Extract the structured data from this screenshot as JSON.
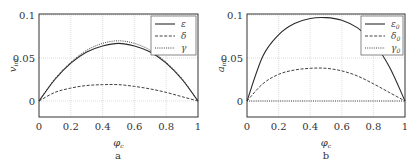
{
  "chart_data": [
    {
      "type": "line",
      "panel_label": "a",
      "title": "",
      "xlabel": "φ_{c_i}",
      "ylabel": "v_{ini}",
      "xlim": [
        0,
        1
      ],
      "ylim": [
        -0.02,
        0.1
      ],
      "xticks": [
        0,
        0.2,
        0.4,
        0.6,
        0.8,
        1
      ],
      "xtick_labels": [
        "0",
        "0.2",
        "0.4",
        "0.6",
        "0.8",
        "1"
      ],
      "yticks": [
        0,
        0.05,
        0.1
      ],
      "ytick_labels": [
        "0",
        "0.05",
        "0.1"
      ],
      "grid": true,
      "legend_position": "upper right",
      "x": [
        0,
        0.1,
        0.2,
        0.3,
        0.4,
        0.5,
        0.6,
        0.7,
        0.8,
        0.9,
        1.0
      ],
      "series": [
        {
          "name": "ε",
          "style": "solid",
          "values": [
            0,
            0.025,
            0.044,
            0.057,
            0.064,
            0.067,
            0.064,
            0.057,
            0.044,
            0.025,
            0
          ]
        },
        {
          "name": "δ",
          "style": "dashed",
          "values": [
            0,
            0.01,
            0.015,
            0.018,
            0.019,
            0.019,
            0.017,
            0.014,
            0.01,
            0.005,
            0
          ]
        },
        {
          "name": "γ",
          "style": "dotted",
          "values": [
            0,
            0.026,
            0.045,
            0.059,
            0.067,
            0.07,
            0.067,
            0.059,
            0.045,
            0.026,
            0
          ]
        }
      ]
    },
    {
      "type": "line",
      "panel_label": "b",
      "title": "",
      "xlabel": "φ_{c_i}",
      "ylabel": "a_{ini}",
      "xlim": [
        0,
        1
      ],
      "ylim": [
        -0.02,
        0.1
      ],
      "xticks": [
        0,
        0.2,
        0.4,
        0.6,
        0.8,
        1
      ],
      "xtick_labels": [
        "0",
        "0.2",
        "0.4",
        "0.6",
        "0.8",
        "1"
      ],
      "yticks": [
        0,
        0.05,
        0.1
      ],
      "ytick_labels": [
        "0",
        "0.05",
        "0.1"
      ],
      "grid": true,
      "legend_position": "upper right",
      "x": [
        0,
        0.1,
        0.2,
        0.3,
        0.4,
        0.5,
        0.6,
        0.7,
        0.8,
        0.9,
        1.0
      ],
      "series": [
        {
          "name": "ε_0",
          "style": "solid",
          "values": [
            0,
            0.052,
            0.077,
            0.09,
            0.096,
            0.097,
            0.094,
            0.085,
            0.068,
            0.04,
            0
          ]
        },
        {
          "name": "δ_0",
          "style": "dashed",
          "values": [
            0,
            0.02,
            0.031,
            0.036,
            0.038,
            0.038,
            0.035,
            0.029,
            0.02,
            0.01,
            0
          ]
        },
        {
          "name": "γ_0",
          "style": "dotted",
          "values": [
            0,
            0,
            0,
            0,
            0,
            0,
            0,
            0,
            0,
            0,
            0
          ]
        }
      ]
    }
  ]
}
